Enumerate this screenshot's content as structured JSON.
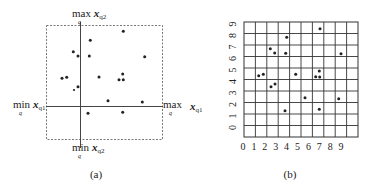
{
  "panel_a": {
    "caption": "(a)",
    "labels": {
      "top": {
        "op": "max",
        "sub": "q",
        "var": "x",
        "var_sub": "q2"
      },
      "bottom": {
        "op": "min",
        "sub": "q",
        "var": "x",
        "var_sub": "q2"
      },
      "left": {
        "op": "min",
        "sub": "q",
        "var": "x",
        "var_sub": "q1"
      },
      "right": {
        "op": "max",
        "sub": "q",
        "var": "x",
        "var_sub": "q1"
      }
    },
    "points": [
      [
        123.3,
        31.3
      ],
      [
        90.3,
        40.3
      ],
      [
        73.3,
        51.7
      ],
      [
        78,
        56
      ],
      [
        89.3,
        56
      ],
      [
        144.7,
        56.7
      ],
      [
        62,
        78.3
      ],
      [
        66.7,
        77.3
      ],
      [
        99,
        77
      ],
      [
        122.7,
        74
      ],
      [
        119,
        79.7
      ],
      [
        123.3,
        79.7
      ],
      [
        78,
        86.7
      ],
      [
        74,
        90
      ],
      [
        108,
        100.7
      ],
      [
        142.3,
        102
      ],
      [
        88,
        113.3
      ],
      [
        122.7,
        112.3
      ]
    ]
  },
  "panel_b": {
    "caption": "(b)",
    "x_ticks": [
      "0",
      "1",
      "2",
      "3",
      "4",
      "5",
      "6",
      "7",
      "8",
      "9"
    ],
    "y_ticks": [
      "0",
      "1",
      "2",
      "3",
      "4",
      "5",
      "6",
      "7",
      "8",
      "9"
    ],
    "grid": {
      "cols": 10,
      "rows": 10
    },
    "points": [
      [
        320,
        28.7
      ],
      [
        286.7,
        37.3
      ],
      [
        270.3,
        48.7
      ],
      [
        274.7,
        53
      ],
      [
        285.7,
        53.3
      ],
      [
        341,
        53.7
      ],
      [
        258.7,
        75.7
      ],
      [
        263.3,
        74.3
      ],
      [
        295.7,
        74.3
      ],
      [
        319.3,
        71
      ],
      [
        315.7,
        76.7
      ],
      [
        319.7,
        77
      ],
      [
        275,
        84
      ],
      [
        271,
        86.7
      ],
      [
        305,
        97.7
      ],
      [
        338.7,
        98.7
      ],
      [
        285,
        110.7
      ],
      [
        319.3,
        109.3
      ]
    ]
  },
  "chart_data": {
    "type": "scatter",
    "title": "",
    "panels": [
      {
        "name": "(a)",
        "description": "Points in continuous (x_q1, x_q2) space bounded by min/max per dimension",
        "xlabel": "x_q1",
        "ylabel": "x_q2"
      },
      {
        "name": "(b)",
        "description": "Same points mapped onto a 10x10 discretized grid",
        "x_ticks": [
          0,
          1,
          2,
          3,
          4,
          5,
          6,
          7,
          8,
          9
        ],
        "y_ticks": [
          0,
          1,
          2,
          3,
          4,
          5,
          6,
          7,
          8,
          9
        ],
        "grid": true
      }
    ]
  }
}
